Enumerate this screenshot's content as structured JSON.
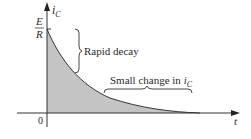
{
  "diagram": {
    "type": "exponential-decay",
    "y_axis": {
      "label_main": "i",
      "label_sub": "C"
    },
    "x_axis": {
      "label": "t"
    },
    "origin_label": "0",
    "initial_value": {
      "numerator": "E",
      "denominator": "R"
    },
    "annotations": {
      "rapid_decay": "Rapid decay",
      "small_change_prefix": "Small change in ",
      "small_change_var": "i",
      "small_change_sub": "C"
    },
    "colors": {
      "fill": "#c4c4c4",
      "stroke": "#333333",
      "text": "#2a2a2a"
    }
  }
}
